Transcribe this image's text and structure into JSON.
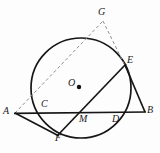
{
  "figure": {
    "type": "geometry-diagram",
    "title": "",
    "width": 160,
    "height": 153,
    "background_color": "#fdfdfd",
    "stroke_color": "#161616",
    "dashed_color": "#8a8a8a"
  },
  "circle": {
    "name": "circle-O",
    "center_label": "O",
    "center_x": 81,
    "center_y": 88,
    "radius": 50,
    "stroke_width": 1.6
  },
  "points": [
    {
      "id": "A",
      "label": "A",
      "x": 15,
      "y": 113,
      "label_x": 4,
      "label_y": 107
    },
    {
      "id": "B",
      "label": "B",
      "x": 145,
      "y": 112,
      "label_x": 147,
      "label_y": 106
    },
    {
      "id": "C",
      "label": "C",
      "x": 44,
      "y": 113,
      "label_x": 41,
      "label_y": 99
    },
    {
      "id": "D",
      "label": "D",
      "x": 118,
      "y": 113,
      "label_x": 113,
      "label_y": 114
    },
    {
      "id": "E",
      "label": "E",
      "x": 124,
      "y": 66,
      "label_x": 127,
      "label_y": 56
    },
    {
      "id": "F",
      "label": "F",
      "x": 58,
      "y": 134,
      "label_x": 56,
      "label_y": 134
    },
    {
      "id": "G",
      "label": "G",
      "x": 103,
      "y": 21,
      "label_x": 99,
      "label_y": 8
    },
    {
      "id": "M",
      "label": "M",
      "x": 86,
      "y": 113,
      "label_x": 79,
      "label_y": 114
    },
    {
      "id": "O",
      "label": "O",
      "x": 79,
      "y": 87,
      "label_x": 68,
      "label_y": 78
    }
  ],
  "segments": [
    {
      "name": "segment-AB",
      "from": "A",
      "to": "B",
      "style": "solid"
    },
    {
      "name": "segment-AF",
      "from": "A",
      "to": "F",
      "style": "solid"
    },
    {
      "name": "segment-FE",
      "from": "F",
      "to": "E",
      "style": "solid"
    },
    {
      "name": "segment-EB",
      "from": "E",
      "to": "B",
      "style": "solid"
    },
    {
      "name": "segment-AG",
      "from": "A",
      "to": "G",
      "style": "dashed"
    },
    {
      "name": "segment-GE",
      "from": "G",
      "to": "E",
      "style": "dashed"
    }
  ],
  "center_dot": {
    "name": "center-dot",
    "x": 79,
    "y": 87,
    "radius": 2.1
  }
}
